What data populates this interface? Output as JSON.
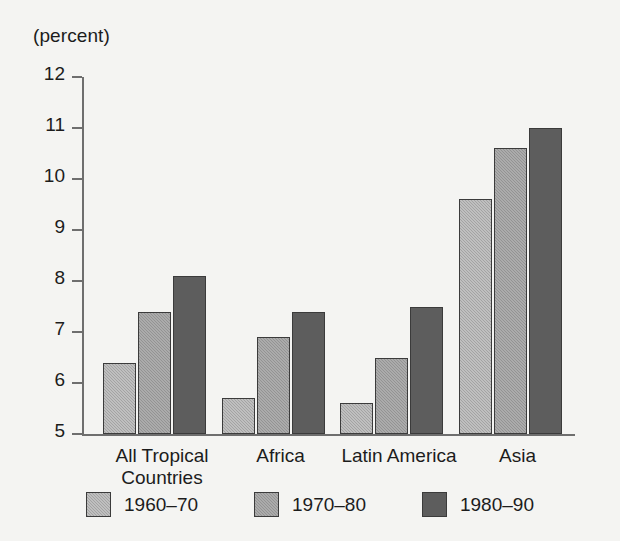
{
  "chart_data": {
    "type": "bar",
    "title": "",
    "subtitle": "",
    "unit_caption": "(percent)",
    "xlabel": "",
    "ylabel": "",
    "ylim": [
      5,
      12
    ],
    "ytick_labels": [
      "12",
      "11",
      "10",
      "9",
      "8",
      "7",
      "6",
      "5"
    ],
    "yticks": [
      12,
      11,
      10,
      9,
      8,
      7,
      6,
      5
    ],
    "grid": false,
    "legend_position": "bottom",
    "categories": [
      "All Tropical\nCountries",
      "Africa",
      "Latin America",
      "Asia"
    ],
    "category_labels_flat": [
      "All Tropical Countries",
      "Africa",
      "Latin America",
      "Asia"
    ],
    "series": [
      {
        "name": "1960–70",
        "color": "#a3a3a3",
        "values": [
          6.4,
          5.7,
          5.6,
          9.6
        ]
      },
      {
        "name": "1970–80",
        "color": "#939393",
        "values": [
          7.4,
          6.9,
          6.5,
          10.6
        ]
      },
      {
        "name": "1980–90",
        "color": "#5d5d5d",
        "values": [
          8.1,
          7.4,
          7.5,
          11.0
        ]
      }
    ]
  },
  "legend": {
    "items": [
      {
        "label": "1960–70"
      },
      {
        "label": "1970–80"
      },
      {
        "label": "1980–90"
      }
    ]
  },
  "axis": {
    "unit_caption": "(percent)"
  }
}
